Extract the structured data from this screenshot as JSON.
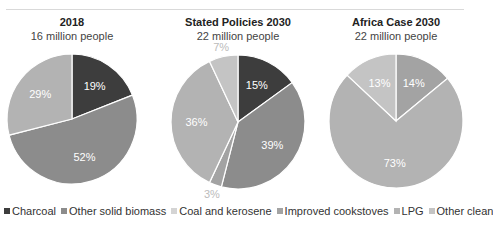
{
  "chart_data": [
    {
      "type": "pie",
      "title": "2018",
      "subtitle": "16 million people",
      "categories": [
        "Charcoal",
        "Other solid biomass",
        "LPG"
      ],
      "values": [
        19,
        52,
        29
      ],
      "labels": [
        "19%",
        "52%",
        "29%"
      ]
    },
    {
      "type": "pie",
      "title": "Stated Policies 2030",
      "subtitle": "22 million people",
      "categories": [
        "Charcoal",
        "Other solid biomass",
        "Improved cookstoves",
        "LPG",
        "Other clean"
      ],
      "values": [
        15,
        39,
        3,
        36,
        7
      ],
      "labels": [
        "15%",
        "39%",
        "3%",
        "36%",
        "7%"
      ]
    },
    {
      "type": "pie",
      "title": "Africa Case 2030",
      "subtitle": "22 million people",
      "categories": [
        "Improved cookstoves",
        "LPG",
        "Other clean"
      ],
      "values": [
        14,
        73,
        13
      ],
      "labels": [
        "14%",
        "73%",
        "13%"
      ]
    }
  ],
  "legend": [
    {
      "label": "Charcoal",
      "color": "#3d3d3d"
    },
    {
      "label": "Other solid biomass",
      "color": "#8c8c8c"
    },
    {
      "label": "Coal and kerosene",
      "color": "#d4d4d4"
    },
    {
      "label": "Improved cookstoves",
      "color": "#a3a3a3"
    },
    {
      "label": "LPG",
      "color": "#b3b3b3"
    },
    {
      "label": "Other clean",
      "color": "#c4c4c4"
    }
  ],
  "panels": [
    {
      "title": "2018",
      "subtitle": "16 million people"
    },
    {
      "title": "Stated Policies 2030",
      "subtitle": "22 million people"
    },
    {
      "title": "Africa Case 2030",
      "subtitle": "22 million people"
    }
  ]
}
